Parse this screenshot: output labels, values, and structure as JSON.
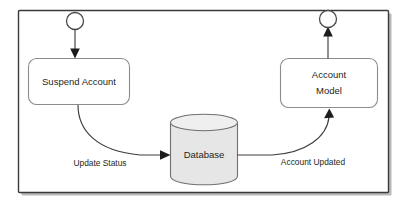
{
  "diagram": {
    "type": "activity-flow",
    "frame": {
      "border_color": "#3a3a3a",
      "background": "#ffffff"
    },
    "nodes": [
      {
        "id": "start",
        "kind": "start-node",
        "shape": "circle",
        "label": "",
        "cx": 75,
        "cy": 21,
        "r": 8.5
      },
      {
        "id": "suspend-account",
        "kind": "process-box",
        "shape": "rounded-rect",
        "label": "Suspend Account",
        "x": 28,
        "y": 58,
        "w": 102,
        "h": 47,
        "fill": "#ffffff"
      },
      {
        "id": "database",
        "kind": "data-store",
        "shape": "cylinder",
        "label": "Database",
        "x": 170,
        "y": 114,
        "w": 68,
        "h": 71,
        "fill": "#e6e6e6"
      },
      {
        "id": "account-model",
        "kind": "process-box",
        "shape": "rounded-rect",
        "label_line1": "Account",
        "label_line2": "Model",
        "x": 280,
        "y": 58,
        "w": 98,
        "h": 50,
        "fill": "#ffffff"
      },
      {
        "id": "end",
        "kind": "end-node",
        "shape": "circle",
        "label": "",
        "cx": 328,
        "cy": 19,
        "r": 8.5
      }
    ],
    "edges": [
      {
        "id": "start-to-suspend",
        "from": "start",
        "to": "suspend-account",
        "label": "",
        "direction": "down",
        "arrow": true
      },
      {
        "id": "suspend-to-database",
        "from": "suspend-account",
        "to": "database",
        "label": "Update Status",
        "label_x": 100,
        "label_y": 163,
        "direction": "right",
        "arrow": true
      },
      {
        "id": "database-to-account-model",
        "from": "database",
        "to": "account-model",
        "label": "Account Updated",
        "label_x": 313,
        "label_y": 162,
        "direction": "up-right",
        "arrow": true
      },
      {
        "id": "account-model-to-end",
        "from": "account-model",
        "to": "end",
        "label": "",
        "direction": "up",
        "arrow": true
      }
    ]
  }
}
